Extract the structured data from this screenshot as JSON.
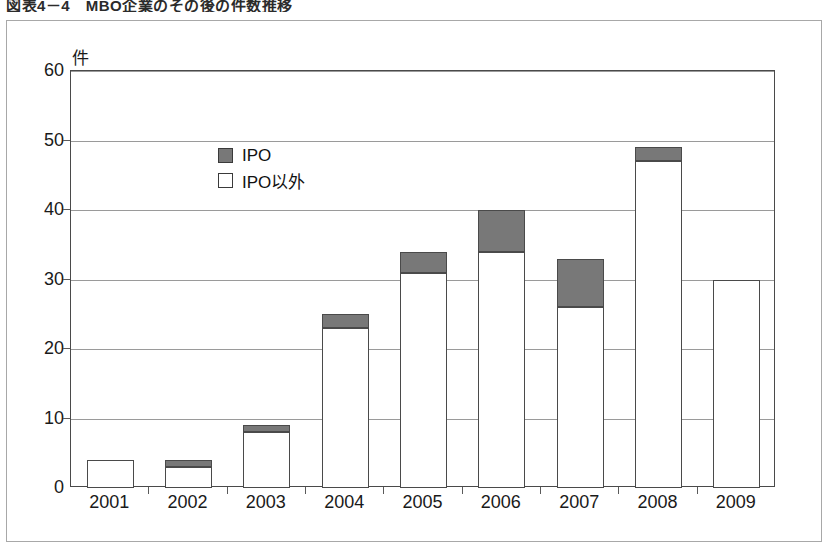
{
  "caption": "図表4－4　MBO企業のその後の件数推移",
  "chart_data": {
    "type": "bar",
    "stacked": true,
    "title": "",
    "xlabel": "",
    "ylabel": "件",
    "ylim": [
      0,
      60
    ],
    "ytick_step": 10,
    "yticks": [
      "60",
      "50",
      "40",
      "30",
      "20",
      "10",
      "0"
    ],
    "grid": true,
    "legend_position": "inside-upper-left",
    "categories": [
      "2001",
      "2002",
      "2003",
      "2004",
      "2005",
      "2006",
      "2007",
      "2008",
      "2009"
    ],
    "series": [
      {
        "name": "IPO以外",
        "key": "other",
        "color": "#ffffff",
        "values": [
          4,
          3,
          8,
          23,
          31,
          34,
          26,
          47,
          30
        ]
      },
      {
        "name": "IPO",
        "key": "ipo",
        "color": "#787878",
        "values": [
          0,
          1,
          1,
          2,
          3,
          6,
          7,
          2,
          0
        ]
      }
    ],
    "totals": [
      4,
      4,
      9,
      25,
      34,
      40,
      33,
      49,
      30
    ]
  },
  "legend": {
    "items": [
      {
        "label": "IPO",
        "swatch": "filled-gray"
      },
      {
        "label": "IPO以外",
        "swatch": "outline-white"
      }
    ]
  }
}
